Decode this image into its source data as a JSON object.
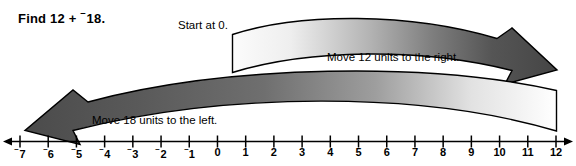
{
  "problem": {
    "title_prefix": "Find 12 + ",
    "title_negative_sign": "⁻",
    "title_value": "18.",
    "full_title": "Find 12 + ⁻18."
  },
  "labels": {
    "start": "Start at 0.",
    "move_right": "Move 12 units to the right.",
    "move_left": "Move 18 units to the left."
  },
  "arrows": [
    {
      "name": "move-right-arrow",
      "direction": "right",
      "units": 12,
      "from_value": 0,
      "to_value": 12,
      "gradient_from": "#fbfbfb",
      "gradient_to": "#4a4a4a",
      "outline": "#000000"
    },
    {
      "name": "move-left-arrow",
      "direction": "left",
      "units": 18,
      "from_value": 12,
      "to_value": -6,
      "gradient_from": "#ffffff",
      "gradient_to": "#4e4e4e",
      "outline": "#000000"
    }
  ],
  "numberline": {
    "min": -7,
    "max": 12,
    "step": 1,
    "axis_color": "#000000",
    "left_arrowhead": true,
    "right_arrowhead": true,
    "ticks": [
      {
        "value": -7,
        "label": "⁻7"
      },
      {
        "value": -6,
        "label": "⁻6"
      },
      {
        "value": -5,
        "label": "⁻5"
      },
      {
        "value": -4,
        "label": "⁻4"
      },
      {
        "value": -3,
        "label": "⁻3"
      },
      {
        "value": -2,
        "label": "⁻2"
      },
      {
        "value": -1,
        "label": "⁻1"
      },
      {
        "value": 0,
        "label": "0"
      },
      {
        "value": 1,
        "label": "1"
      },
      {
        "value": 2,
        "label": "2"
      },
      {
        "value": 3,
        "label": "3"
      },
      {
        "value": 4,
        "label": "4"
      },
      {
        "value": 5,
        "label": "5"
      },
      {
        "value": 6,
        "label": "6"
      },
      {
        "value": 7,
        "label": "7"
      },
      {
        "value": 8,
        "label": "8"
      },
      {
        "value": 9,
        "label": "9"
      },
      {
        "value": 10,
        "label": "10"
      },
      {
        "value": 11,
        "label": "11"
      },
      {
        "value": 12,
        "label": "12"
      }
    ]
  }
}
